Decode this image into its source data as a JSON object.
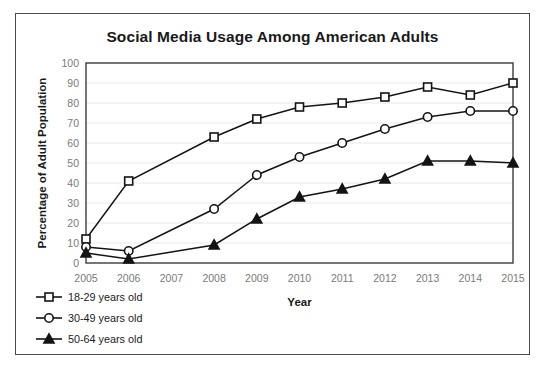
{
  "chart_data": {
    "type": "line",
    "title": "Social Media Usage Among American Adults",
    "xlabel": "Year",
    "ylabel": "Percentage of Adult Population",
    "categories": [
      "2005",
      "2006",
      "2007",
      "2008",
      "2009",
      "2010",
      "2011",
      "2012",
      "2013",
      "2014",
      "2015"
    ],
    "x": [
      2005,
      2006,
      2007,
      2008,
      2009,
      2010,
      2011,
      2012,
      2013,
      2014,
      2015
    ],
    "xlim": [
      2005,
      2015
    ],
    "ylim": [
      0,
      100
    ],
    "ytick_values": [
      0,
      10,
      20,
      30,
      40,
      50,
      60,
      70,
      80,
      90,
      100
    ],
    "xtick_labels": [
      "2005",
      "2006",
      "2007",
      "2008",
      "2009",
      "2010",
      "2011",
      "2012",
      "2013",
      "2014",
      "2015"
    ],
    "grid": true,
    "legend_position": "bottom-left",
    "series": [
      {
        "name": "18-29 years old",
        "marker": "square-open",
        "values": [
          12,
          41,
          null,
          63,
          72,
          78,
          80,
          83,
          88,
          84,
          90
        ]
      },
      {
        "name": "30-49 years old",
        "marker": "circle-open",
        "values": [
          8,
          6,
          null,
          27,
          44,
          53,
          60,
          67,
          73,
          76,
          76
        ]
      },
      {
        "name": "50-64 years old",
        "marker": "triangle-solid",
        "values": [
          5,
          2,
          null,
          9,
          22,
          33,
          37,
          42,
          51,
          51,
          50
        ]
      }
    ]
  },
  "colors": {
    "line": "#141414",
    "grid": "#e8e8e8",
    "frame": "#3c3c3c",
    "tick_text": "#7a7a7a",
    "title_text": "#1a1a1a",
    "figure_border": "#4a4a4a"
  }
}
